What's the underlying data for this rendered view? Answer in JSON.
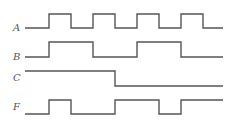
{
  "diagram": {
    "type": "timing-diagram",
    "x_start": 25,
    "x_end": 223,
    "stroke_color": "#555555",
    "signals": [
      {
        "name": "A",
        "low_y": 28,
        "high_y": 14,
        "initial": 0,
        "transitions": [
          49,
          71,
          93,
          115,
          137,
          159,
          181,
          203
        ]
      },
      {
        "name": "B",
        "low_y": 57,
        "high_y": 42,
        "initial": 0,
        "transitions": [
          49,
          93,
          137,
          181
        ]
      },
      {
        "name": "C",
        "low_y": 86,
        "high_y": 71,
        "initial": 1,
        "transitions": [
          115
        ]
      },
      {
        "name": "F",
        "low_y": 114,
        "high_y": 100,
        "initial": 0,
        "transitions": [
          49,
          71,
          115,
          159,
          181
        ]
      }
    ]
  }
}
